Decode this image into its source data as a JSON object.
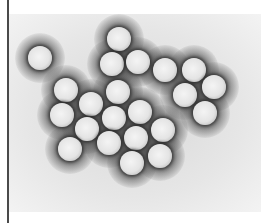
{
  "image": {
    "description": "Grayscale micrograph showing a cluster of spherical particles",
    "particle_count": 24,
    "colors": {
      "background": "#f0f0f0",
      "stain": "#5a5a5a",
      "particle": "#ececec",
      "frame_line": "#4a4a4a"
    },
    "particles": [
      {
        "x": 40,
        "y": 58,
        "r": 12
      },
      {
        "x": 119,
        "y": 39,
        "r": 12
      },
      {
        "x": 112,
        "y": 64,
        "r": 12
      },
      {
        "x": 138,
        "y": 62,
        "r": 12
      },
      {
        "x": 165,
        "y": 70,
        "r": 12
      },
      {
        "x": 194,
        "y": 70,
        "r": 12
      },
      {
        "x": 214,
        "y": 87,
        "r": 12
      },
      {
        "x": 185,
        "y": 95,
        "r": 12
      },
      {
        "x": 205,
        "y": 113,
        "r": 12
      },
      {
        "x": 66,
        "y": 90,
        "r": 12
      },
      {
        "x": 118,
        "y": 92,
        "r": 12
      },
      {
        "x": 91,
        "y": 104,
        "r": 12
      },
      {
        "x": 62,
        "y": 115,
        "r": 12
      },
      {
        "x": 114,
        "y": 118,
        "r": 12
      },
      {
        "x": 140,
        "y": 112,
        "r": 12
      },
      {
        "x": 87,
        "y": 129,
        "r": 12
      },
      {
        "x": 163,
        "y": 130,
        "r": 12
      },
      {
        "x": 136,
        "y": 138,
        "r": 12
      },
      {
        "x": 109,
        "y": 143,
        "r": 12
      },
      {
        "x": 70,
        "y": 149,
        "r": 12
      },
      {
        "x": 160,
        "y": 156,
        "r": 12
      },
      {
        "x": 132,
        "y": 163,
        "r": 12
      }
    ]
  }
}
